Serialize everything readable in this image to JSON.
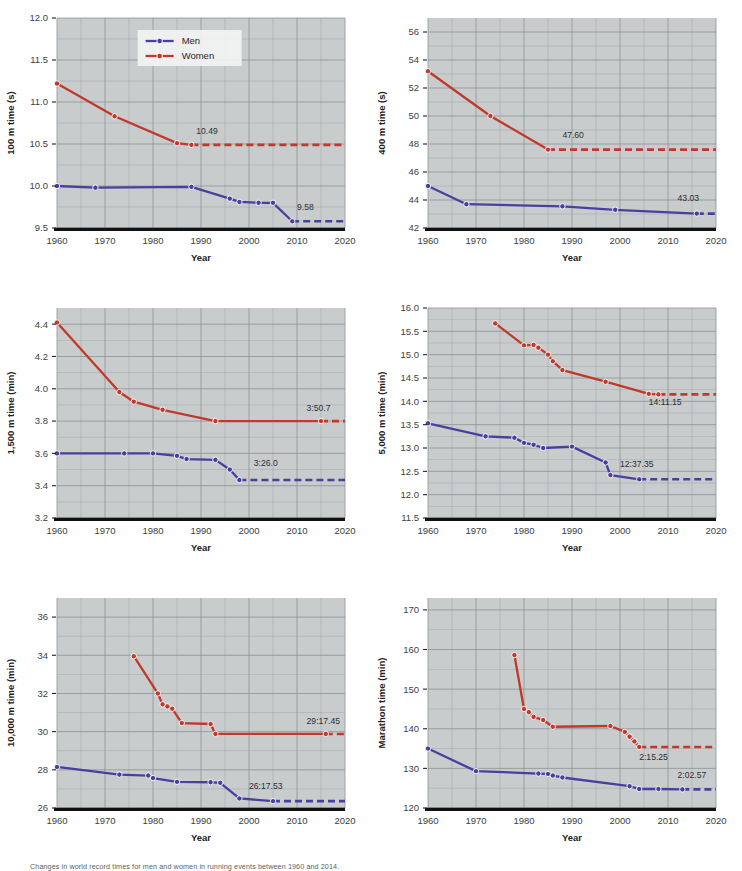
{
  "figure": {
    "caption": "Changes in world record times for men and women in running events between 1960 and 2014.",
    "legend": {
      "men": "Men",
      "women": "Women",
      "men_color": "#4b3f9e",
      "women_color": "#c0392b"
    },
    "xlabel": "Year",
    "colors": {
      "men": "#4b3f9e",
      "women": "#c0392b",
      "plot_bg": "#c9cccd",
      "grid": "#8b9095",
      "axis": "#111111",
      "page_bg": "#ffffff"
    }
  },
  "chart_data": [
    {
      "type": "line",
      "title": "100 m",
      "ylabel": "100 m time (s)",
      "xlabel": "Year",
      "xlim": [
        1960,
        2020
      ],
      "ylim": [
        9.5,
        12.0
      ],
      "xticks": [
        1960,
        1970,
        1980,
        1990,
        2000,
        2010,
        2020
      ],
      "yticks": [
        9.5,
        10.0,
        10.5,
        11.0,
        11.5,
        12.0
      ],
      "grid": true,
      "legend": "top-center",
      "annotations": [
        {
          "series": "Women",
          "text": "10.49",
          "x": 1989,
          "y": 10.62
        },
        {
          "series": "Men",
          "text": "9.58",
          "x": 2010,
          "y": 9.72
        }
      ],
      "series": [
        {
          "name": "Men",
          "color": "#4b3f9e",
          "points": [
            [
              1960,
              10.0
            ],
            [
              1968,
              9.98
            ],
            [
              1988,
              9.99
            ],
            [
              1996,
              9.85
            ],
            [
              1998,
              9.81
            ],
            [
              2002,
              9.8
            ],
            [
              2005,
              9.8
            ],
            [
              2009,
              9.58
            ]
          ],
          "projection": {
            "from": [
              2009,
              9.58
            ],
            "to": [
              2020,
              9.58
            ],
            "style": "dashed"
          }
        },
        {
          "name": "Women",
          "color": "#c0392b",
          "points": [
            [
              1960,
              11.22
            ],
            [
              1972,
              10.83
            ],
            [
              1985,
              10.51
            ],
            [
              1988,
              10.49
            ]
          ],
          "projection": {
            "from": [
              1988,
              10.49
            ],
            "to": [
              2020,
              10.49
            ],
            "style": "dashed"
          }
        }
      ]
    },
    {
      "type": "line",
      "title": "400 m",
      "ylabel": "400 m time (s)",
      "xlabel": "Year",
      "xlim": [
        1960,
        2020
      ],
      "ylim": [
        42,
        57
      ],
      "xticks": [
        1960,
        1970,
        1980,
        1990,
        2000,
        2010,
        2020
      ],
      "yticks": [
        42,
        44,
        46,
        48,
        50,
        52,
        54,
        56
      ],
      "grid": true,
      "legend": "none",
      "annotations": [
        {
          "series": "Women",
          "text": "47.60",
          "x": 1988,
          "y": 48.4
        },
        {
          "series": "Men",
          "text": "43.03",
          "x": 2012,
          "y": 43.9
        }
      ],
      "series": [
        {
          "name": "Men",
          "color": "#4b3f9e",
          "points": [
            [
              1960,
              45.0
            ],
            [
              1968,
              43.7
            ],
            [
              1988,
              43.55
            ],
            [
              1999,
              43.3
            ],
            [
              2016,
              43.03
            ]
          ],
          "projection": {
            "from": [
              2016,
              43.03
            ],
            "to": [
              2020,
              43.03
            ],
            "style": "dashed"
          }
        },
        {
          "name": "Women",
          "color": "#c0392b",
          "points": [
            [
              1960,
              53.2
            ],
            [
              1973,
              50.0
            ],
            [
              1985,
              47.6
            ]
          ],
          "projection": {
            "from": [
              1985,
              47.6
            ],
            "to": [
              2020,
              47.6
            ],
            "style": "dashed"
          }
        }
      ]
    },
    {
      "type": "line",
      "title": "1,500 m",
      "ylabel": "1,500 m time (min)",
      "xlabel": "Year",
      "xlim": [
        1960,
        2020
      ],
      "ylim": [
        3.2,
        4.5
      ],
      "xticks": [
        1960,
        1970,
        1980,
        1990,
        2000,
        2010,
        2020
      ],
      "yticks": [
        3.2,
        3.4,
        3.6,
        3.8,
        4.0,
        4.2,
        4.4
      ],
      "grid": true,
      "legend": "none",
      "annotations": [
        {
          "series": "Women",
          "text": "3:50.7",
          "x": 2012,
          "y": 3.86
        },
        {
          "series": "Men",
          "text": "3:26.0",
          "x": 2001,
          "y": 3.52
        }
      ],
      "series": [
        {
          "name": "Men",
          "color": "#4b3f9e",
          "points": [
            [
              1960,
              3.6
            ],
            [
              1974,
              3.6
            ],
            [
              1980,
              3.6
            ],
            [
              1985,
              3.585
            ],
            [
              1987,
              3.565
            ],
            [
              1993,
              3.56
            ],
            [
              1996,
              3.5
            ],
            [
              1998,
              3.435
            ]
          ],
          "projection": {
            "from": [
              1998,
              3.435
            ],
            "to": [
              2020,
              3.435
            ],
            "style": "dashed"
          }
        },
        {
          "name": "Women",
          "color": "#c0392b",
          "points": [
            [
              1960,
              4.41
            ],
            [
              1973,
              3.98
            ],
            [
              1976,
              3.92
            ],
            [
              1982,
              3.87
            ],
            [
              1993,
              3.8
            ],
            [
              2015,
              3.8
            ]
          ],
          "projection": {
            "from": [
              2015,
              3.8
            ],
            "to": [
              2020,
              3.8
            ],
            "style": "dashed"
          }
        }
      ]
    },
    {
      "type": "line",
      "title": "5,000 m",
      "ylabel": "5,000 m time (min)",
      "xlabel": "Year",
      "xlim": [
        1960,
        2020
      ],
      "ylim": [
        11.5,
        16.0
      ],
      "xticks": [
        1960,
        1970,
        1980,
        1990,
        2000,
        2010,
        2020
      ],
      "yticks": [
        11.5,
        12.0,
        12.5,
        13.0,
        13.5,
        14.0,
        14.5,
        15.0,
        15.5,
        16.0
      ],
      "grid": true,
      "legend": "none",
      "annotations": [
        {
          "series": "Women",
          "text": "14:11.15",
          "x": 2006,
          "y": 13.92
        },
        {
          "series": "Men",
          "text": "12:37.35",
          "x": 2000,
          "y": 12.6
        }
      ],
      "series": [
        {
          "name": "Men",
          "color": "#4b3f9e",
          "points": [
            [
              1960,
              13.53
            ],
            [
              1972,
              13.25
            ],
            [
              1978,
              13.22
            ],
            [
              1980,
              13.11
            ],
            [
              1982,
              13.07
            ],
            [
              1984,
              13.0
            ],
            [
              1990,
              13.03
            ],
            [
              1997,
              12.69
            ],
            [
              1998,
              12.42
            ],
            [
              2004,
              12.33
            ]
          ],
          "projection": {
            "from": [
              2004,
              12.33
            ],
            "to": [
              2020,
              12.33
            ],
            "style": "dashed"
          }
        },
        {
          "name": "Women",
          "color": "#c0392b",
          "points": [
            [
              1974,
              15.67
            ],
            [
              1980,
              15.2
            ],
            [
              1982,
              15.21
            ],
            [
              1983,
              15.15
            ],
            [
              1985,
              15.0
            ],
            [
              1986,
              14.86
            ],
            [
              1988,
              14.67
            ],
            [
              1997,
              14.42
            ],
            [
              2006,
              14.16
            ],
            [
              2008,
              14.15
            ]
          ],
          "projection": {
            "from": [
              2008,
              14.15
            ],
            "to": [
              2020,
              14.15
            ],
            "style": "dashed"
          }
        }
      ]
    },
    {
      "type": "line",
      "title": "10,000 m",
      "ylabel": "10,000 m time (min)",
      "xlabel": "Year",
      "xlim": [
        1960,
        2020
      ],
      "ylim": [
        26,
        37
      ],
      "xticks": [
        1960,
        1970,
        1980,
        1990,
        2000,
        2010,
        2020
      ],
      "yticks": [
        26,
        28,
        30,
        32,
        34,
        36
      ],
      "grid": true,
      "legend": "none",
      "annotations": [
        {
          "series": "Women",
          "text": "29:17.45",
          "x": 2012,
          "y": 30.4
        },
        {
          "series": "Men",
          "text": "26:17.53",
          "x": 2000,
          "y": 27.0
        }
      ],
      "series": [
        {
          "name": "Men",
          "color": "#4b3f9e",
          "points": [
            [
              1960,
              28.15
            ],
            [
              1973,
              27.75
            ],
            [
              1979,
              27.7
            ],
            [
              1980,
              27.57
            ],
            [
              1985,
              27.37
            ],
            [
              1992,
              27.35
            ],
            [
              1994,
              27.32
            ],
            [
              1998,
              26.5
            ],
            [
              2005,
              26.36
            ]
          ],
          "projection": {
            "from": [
              2005,
              26.36
            ],
            "to": [
              2020,
              26.36
            ],
            "style": "dashed"
          }
        },
        {
          "name": "Women",
          "color": "#c0392b",
          "points": [
            [
              1976,
              33.95
            ],
            [
              1981,
              32.0
            ],
            [
              1982,
              31.43
            ],
            [
              1983,
              31.32
            ],
            [
              1984,
              31.2
            ],
            [
              1986,
              30.45
            ],
            [
              1992,
              30.4
            ],
            [
              1993,
              29.88
            ],
            [
              2016,
              29.88
            ]
          ],
          "projection": {
            "from": [
              2016,
              29.88
            ],
            "to": [
              2020,
              29.88
            ],
            "style": "dashed"
          }
        }
      ]
    },
    {
      "type": "line",
      "title": "Marathon",
      "ylabel": "Marathon time (min)",
      "xlabel": "Year",
      "xlim": [
        1960,
        2020
      ],
      "ylim": [
        120,
        173
      ],
      "xticks": [
        1960,
        1970,
        1980,
        1990,
        2000,
        2010,
        2020
      ],
      "yticks": [
        120,
        130,
        140,
        150,
        160,
        170
      ],
      "grid": true,
      "legend": "none",
      "annotations": [
        {
          "series": "Women",
          "text": "2:15.25",
          "x": 2004,
          "y": 132.0
        },
        {
          "series": "Men",
          "text": "2:02.57",
          "x": 2012,
          "y": 127.6
        }
      ],
      "series": [
        {
          "name": "Men",
          "color": "#4b3f9e",
          "points": [
            [
              1960,
              135.0
            ],
            [
              1970,
              129.3
            ],
            [
              1983,
              128.7
            ],
            [
              1985,
              128.6
            ],
            [
              1986,
              128.2
            ],
            [
              1988,
              127.7
            ],
            [
              2002,
              125.5
            ],
            [
              2004,
              124.8
            ],
            [
              2008,
              124.8
            ],
            [
              2013,
              124.7
            ]
          ],
          "projection": {
            "from": [
              2013,
              124.7
            ],
            "to": [
              2020,
              124.7
            ],
            "style": "dashed"
          }
        },
        {
          "name": "Women",
          "color": "#c0392b",
          "points": [
            [
              1978,
              158.6
            ],
            [
              1980,
              145.0
            ],
            [
              1981,
              144.2
            ],
            [
              1982,
              143.0
            ],
            [
              1984,
              142.2
            ],
            [
              1986,
              140.5
            ],
            [
              1998,
              140.7
            ],
            [
              2001,
              139.2
            ],
            [
              2002,
              138.0
            ],
            [
              2003,
              136.8
            ],
            [
              2004,
              135.4
            ]
          ],
          "projection": {
            "from": [
              2004,
              135.4
            ],
            "to": [
              2020,
              135.4
            ],
            "style": "dashed"
          }
        }
      ]
    }
  ]
}
